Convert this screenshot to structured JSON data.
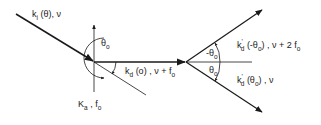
{
  "diagram": {
    "type": "wave-vector scattering diagram (acousto-optic diffraction)",
    "colors": {
      "line": "#1a1a1a",
      "background": "#ffffff"
    },
    "labels": {
      "incident": {
        "k": "k",
        "sub": "i",
        "rest": " (θ), ν"
      },
      "acoustic": {
        "k": "K",
        "sub": "a",
        "rest": " , f",
        "rest_sub": "o"
      },
      "diffracted_first": {
        "k": "k",
        "sub": "d",
        "rest": " (o) ,  ν + f",
        "rest_sub": "o"
      },
      "diffracted_up": {
        "k": "k",
        "sup": "'",
        "sub": "d",
        "rest": " (-θ",
        "rest_sub": "o",
        "rest2": ") ,  ν + 2 f",
        "rest2_sub": "o"
      },
      "diffracted_down": {
        "k": "k",
        "sup": "'",
        "sub": "d",
        "rest": " (θ",
        "rest_sub": "o",
        "rest2": ") ,  ν"
      },
      "angle_left": {
        "sym": "θ",
        "sub": "o"
      },
      "angle_upper": {
        "sym": "-θ",
        "sub": "o"
      },
      "angle_lower": {
        "sym": "θ",
        "sub": "o"
      }
    }
  }
}
